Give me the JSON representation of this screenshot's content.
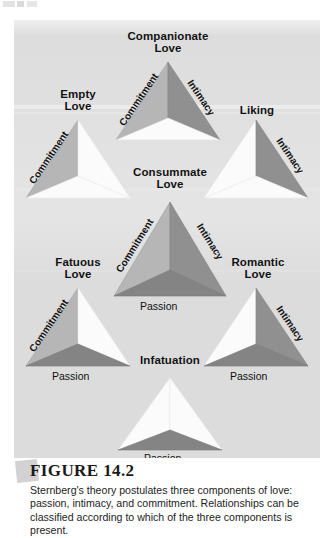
{
  "figure": {
    "number_label": "FIGURE 14.2",
    "caption": "Sternberg's theory postulates three components of love: passion, intimacy, and commitment. Relationships can be classified according to which of the three components is present."
  },
  "legend_terms": {
    "commitment": "Commitment",
    "intimacy": "Intimacy",
    "passion": "Passion"
  },
  "colors": {
    "panel_background": "#dcdcdc",
    "commitment_fill": "#b6b6b6",
    "intimacy_fill": "#9a9a9a",
    "passion_fill": "#848484",
    "empty_fill": "#fbfbfb",
    "text": "#111111",
    "page_background": "#ffffff"
  },
  "diagram": {
    "type": "triangular-love-theory",
    "triangles": [
      {
        "id": "companionate",
        "title": "Companionate\nLove",
        "side_labels": [
          "Commitment",
          "Intimacy"
        ],
        "base_label": "",
        "components_present": [
          "Commitment",
          "Intimacy"
        ]
      },
      {
        "id": "empty",
        "title": "Empty\nLove",
        "side_labels": [
          "Commitment"
        ],
        "base_label": "",
        "components_present": [
          "Commitment"
        ]
      },
      {
        "id": "liking",
        "title": "Liking",
        "side_labels": [
          "Intimacy"
        ],
        "base_label": "",
        "components_present": [
          "Intimacy"
        ]
      },
      {
        "id": "consummate",
        "title": "Consummate\nLove",
        "side_labels": [
          "Commitment",
          "Intimacy"
        ],
        "base_label": "Passion",
        "components_present": [
          "Commitment",
          "Intimacy",
          "Passion"
        ]
      },
      {
        "id": "fatuous",
        "title": "Fatuous\nLove",
        "side_labels": [
          "Commitment"
        ],
        "base_label": "Passion",
        "components_present": [
          "Commitment",
          "Passion"
        ]
      },
      {
        "id": "romantic",
        "title": "Romantic\nLove",
        "side_labels": [
          "Intimacy"
        ],
        "base_label": "Passion",
        "components_present": [
          "Intimacy",
          "Passion"
        ]
      },
      {
        "id": "infatuation",
        "title": "Infatuation",
        "side_labels": [],
        "base_label": "Passion",
        "components_present": [
          "Passion"
        ]
      }
    ]
  }
}
